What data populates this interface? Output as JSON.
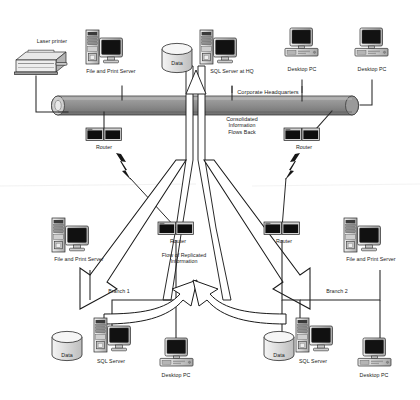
{
  "diagram": {
    "type": "network-topology",
    "colors": {
      "backbone": "#8f8f8f",
      "backbone_dark": "#6e6e6e",
      "device_case": "#d6d6d6",
      "device_shade": "#a8a8a8",
      "screen": "#121212",
      "outline": "#1a1a1a",
      "arrow_fill": "#ffffff",
      "paper": "#ffffff"
    },
    "zones": {
      "hq": "Corporate Headquarters",
      "branch1": "Branch 1",
      "branch2": "Branch 2"
    },
    "flows": {
      "down": "Flow of Replicated\nInformation",
      "up": "Consolidated\nInformation\nFlows Back"
    }
  },
  "labels": {
    "laser_printer": "Laser printer",
    "file_print_server_hq": "File and Print Server",
    "data_hq": "Data",
    "sql_server_hq": "SQL Server at HQ",
    "desktop_pc_hq_1": "Desktop PC",
    "desktop_pc_hq_2": "Desktop PC",
    "corporate_headquarters": "Corporate Headquarters",
    "router_hq_left": "Router",
    "router_hq_right": "Router",
    "consolidated_flow": "Consolidated\nInformation\nFlows Back",
    "replicated_flow": "Flow of Replicated\nInformation",
    "branch1": "Branch 1",
    "branch1_file_print_server": "File and Print Server",
    "branch1_router": "Router",
    "branch1_data": "Data",
    "branch1_sql_server": "SQL Server",
    "branch1_desktop_pc": "Desktop PC",
    "branch2": "Branch 2",
    "branch2_file_print_server": "File and Print Server",
    "branch2_router": "Router",
    "branch2_data": "Data",
    "branch2_sql_server": "SQL Server",
    "branch2_desktop_pc": "Desktop PC"
  },
  "nodes": [
    {
      "id": "laser-printer",
      "label": "Laser printer",
      "kind": "printer",
      "zone": "hq",
      "x": 50,
      "y": 60
    },
    {
      "id": "fps-hq",
      "label": "File and Print Server",
      "kind": "server-tower-monitor",
      "zone": "hq",
      "x": 110,
      "y": 50
    },
    {
      "id": "data-hq",
      "label": "Data",
      "kind": "database",
      "zone": "hq",
      "x": 178,
      "y": 57
    },
    {
      "id": "sql-hq",
      "label": "SQL Server at HQ",
      "kind": "server-tower-monitor",
      "zone": "hq",
      "x": 222,
      "y": 50
    },
    {
      "id": "pc-hq-1",
      "label": "Desktop PC",
      "kind": "desktop-pc",
      "zone": "hq",
      "x": 290,
      "y": 48
    },
    {
      "id": "pc-hq-2",
      "label": "Desktop PC",
      "kind": "desktop-pc",
      "zone": "hq",
      "x": 360,
      "y": 48
    },
    {
      "id": "router-hq-left",
      "label": "Router",
      "kind": "router",
      "zone": "hq",
      "x": 112,
      "y": 131
    },
    {
      "id": "router-hq-right",
      "label": "Router",
      "kind": "router",
      "zone": "hq",
      "x": 310,
      "y": 131
    },
    {
      "id": "fps-b1",
      "label": "File and Print Server",
      "kind": "server-tower-monitor",
      "zone": "branch1",
      "x": 78,
      "y": 240
    },
    {
      "id": "router-b1",
      "label": "Router",
      "kind": "router",
      "zone": "branch1",
      "x": 175,
      "y": 228
    },
    {
      "id": "data-b1",
      "label": "Data",
      "kind": "database",
      "zone": "branch1",
      "x": 68,
      "y": 345
    },
    {
      "id": "sql-b1",
      "label": "SQL Server",
      "kind": "server-tower-monitor",
      "zone": "branch1",
      "x": 118,
      "y": 340
    },
    {
      "id": "pc-b1",
      "label": "Desktop PC",
      "kind": "desktop-pc",
      "zone": "branch1",
      "x": 183,
      "y": 348
    },
    {
      "id": "router-b2",
      "label": "Router",
      "kind": "router",
      "zone": "branch2",
      "x": 278,
      "y": 228
    },
    {
      "id": "fps-b2",
      "label": "File and Print Server",
      "kind": "server-tower-monitor",
      "zone": "branch2",
      "x": 368,
      "y": 240
    },
    {
      "id": "data-b2",
      "label": "Data",
      "kind": "database",
      "zone": "branch2",
      "x": 281,
      "y": 345
    },
    {
      "id": "sql-b2",
      "label": "SQL Server",
      "kind": "server-tower-monitor",
      "zone": "branch2",
      "x": 319,
      "y": 340
    },
    {
      "id": "pc-b2",
      "label": "Desktop PC",
      "kind": "desktop-pc",
      "zone": "branch2",
      "x": 382,
      "y": 348
    }
  ]
}
